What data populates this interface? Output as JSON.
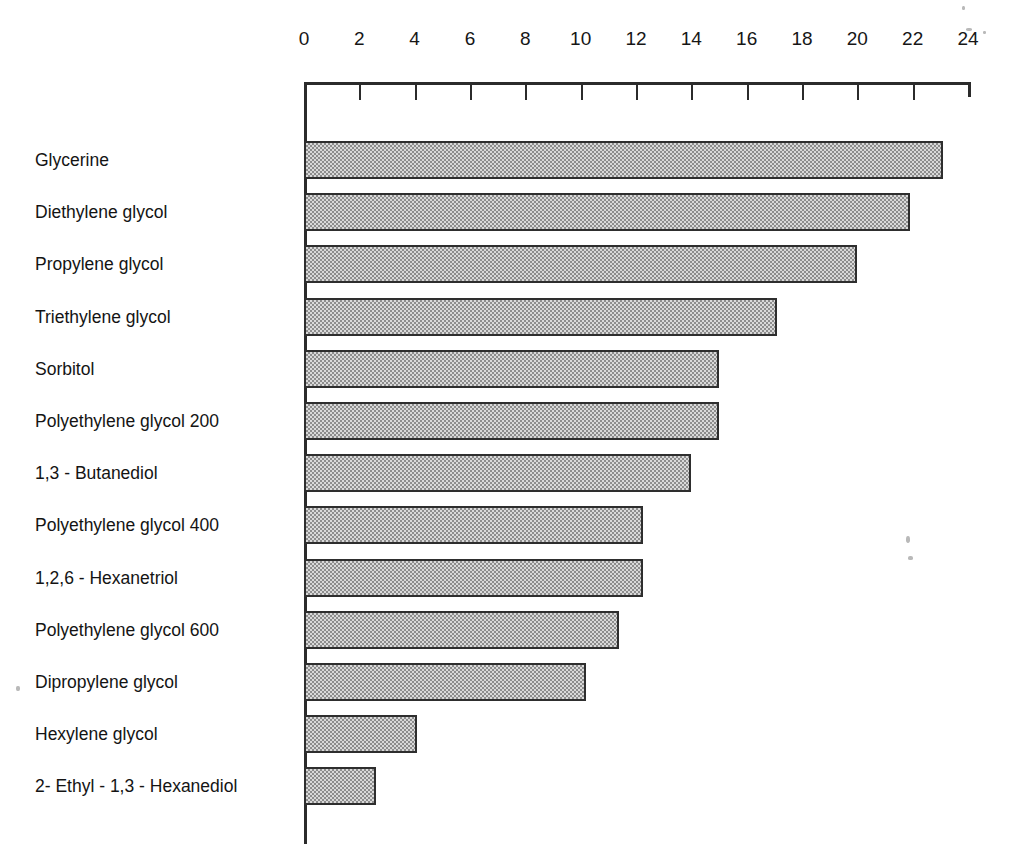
{
  "chart_data": {
    "type": "bar",
    "orientation": "horizontal",
    "title": "",
    "xlabel": "",
    "ylabel": "",
    "xlim": [
      0,
      24
    ],
    "xticks": [
      0,
      2,
      4,
      6,
      8,
      10,
      12,
      14,
      16,
      18,
      20,
      22,
      24
    ],
    "tick_labels": [
      "0",
      "2",
      "4",
      "6",
      "8",
      "10",
      "12",
      "14",
      "16",
      "18",
      "20",
      "22",
      "24"
    ],
    "grid": false,
    "legend": null,
    "categories": [
      "Glycerine",
      "Diethylene glycol",
      "Propylene glycol",
      "Triethylene glycol",
      "Sorbitol",
      "Polyethylene glycol 200",
      "1,3 - Butanediol",
      "Polyethylene glycol 400",
      "1,2,6 - Hexanetriol",
      "Polyethylene glycol 600",
      "Dipropylene glycol",
      "Hexylene glycol",
      "2- Ethyl - 1,3 - Hexanediol"
    ],
    "values": [
      23.1,
      21.9,
      20.0,
      17.1,
      15.0,
      15.0,
      14.0,
      12.25,
      12.25,
      11.4,
      10.2,
      4.1,
      2.6
    ],
    "bar_fill": "#b3b3b3",
    "bar_edge": "#2e2e2e",
    "axis_color": "#2b2b2b"
  }
}
